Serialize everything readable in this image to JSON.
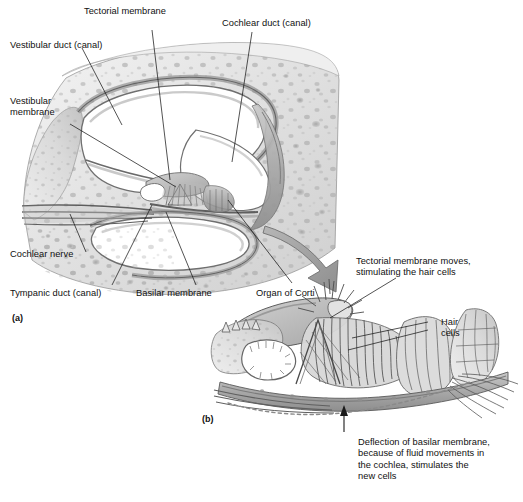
{
  "figure": {
    "type": "anatomical-diagram",
    "style": "grayscale pencil illustration",
    "background_color": "#ffffff",
    "ink_color": "#101010"
  },
  "panel_a": {
    "key": "(a)",
    "description": "Cross-section through one turn of the cochlea",
    "labels": {
      "tectorial_membrane": "Tectorial membrane",
      "cochlear_duct": "Cochlear duct (canal)",
      "vestibular_duct": "Vestibular duct (canal)",
      "vestibular_membrane": "Vestibular\nmembrane",
      "cochlear_nerve": "Cochlear nerve",
      "tympanic_duct": "Tympanic duct (canal)",
      "basilar_membrane": "Basilar membrane",
      "organ_of_corti": "Organ of Corti"
    }
  },
  "panel_b": {
    "key": "(b)",
    "description": "Enlarged view of the organ of Corti",
    "labels": {
      "tectorial_note": "Tectorial membrane moves,\nstimulating the hair cells",
      "hair_cells": "Hair\ncells",
      "deflection_note": "Deflection of basilar membrane,\nbecause of fluid movements in\nthe cochlea, stimulates the\nnew cells"
    }
  },
  "connector": {
    "name": "magnification-arrow",
    "description": "Large curved gray arrow from organ of Corti in panel (a) to panel (b)",
    "color": "#9a9a9a"
  }
}
